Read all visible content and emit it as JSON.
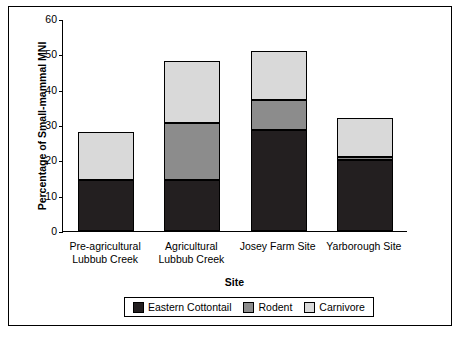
{
  "chart_data": {
    "type": "bar",
    "subtype": "stacked",
    "title": "",
    "xlabel": "Site",
    "ylabel": "Percentage of Small-mammal MNI",
    "ylim": [
      0,
      60
    ],
    "yticks": [
      0,
      10,
      20,
      30,
      40,
      50,
      60
    ],
    "grid": false,
    "legend_position": "bottom",
    "categories": [
      "Pre-agricultural Lubbub Creek",
      "Agricultural Lubbub Creek",
      "Josey Farm Site",
      "Yarborough Site"
    ],
    "category_lines": [
      [
        "Pre-agricultural",
        "Lubbub Creek"
      ],
      [
        "Agricultural",
        "Lubbub Creek"
      ],
      [
        "Josey Farm Site",
        ""
      ],
      [
        "Yarborough Site",
        ""
      ]
    ],
    "series": [
      {
        "name": "Eastern Cottontail",
        "color": "#231f20",
        "values": [
          14.5,
          14.5,
          28.5,
          20
        ]
      },
      {
        "name": "Rodent",
        "color": "#8c8c8c",
        "values": [
          0,
          16,
          8.5,
          1
        ]
      },
      {
        "name": "Carnivore",
        "color": "#d9d9d9",
        "values": [
          13.5,
          17.5,
          14,
          11
        ]
      }
    ],
    "totals": [
      28,
      48,
      51,
      32
    ]
  },
  "legend": {
    "items": [
      {
        "label": "Eastern Cottontail",
        "color": "#231f20"
      },
      {
        "label": "Rodent",
        "color": "#8c8c8c"
      },
      {
        "label": "Carnivore",
        "color": "#d9d9d9"
      }
    ]
  }
}
